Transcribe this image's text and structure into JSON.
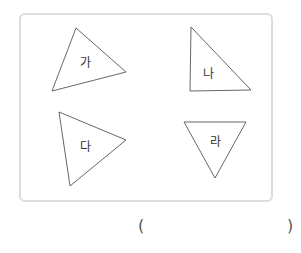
{
  "figure": {
    "border_color": "#dcdcdc",
    "stroke_color": "#555555",
    "triangles": [
      {
        "label": "가",
        "points": "76,28 126,72 52,91",
        "label_x": 85,
        "label_y": 63
      },
      {
        "label": "나",
        "points": "191,27 251,90 190,91",
        "label_x": 208,
        "label_y": 74
      },
      {
        "label": "다",
        "points": "59,112 126,140 70,186",
        "label_x": 85,
        "label_y": 147
      },
      {
        "label": "라",
        "points": "184,122 246,122 215,178",
        "label_x": 215,
        "label_y": 142
      }
    ]
  },
  "answer": {
    "open_paren": "(",
    "close_paren": ")",
    "value": ""
  }
}
